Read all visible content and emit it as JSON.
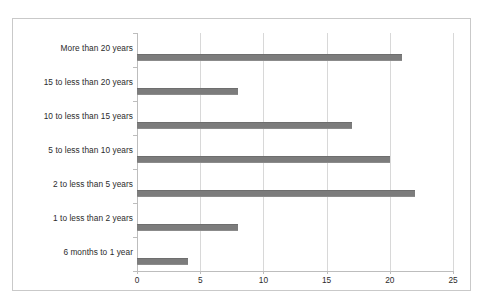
{
  "figure": {
    "background_color": "#ffffff",
    "frame_color": "#c9c9c9",
    "bar_color": "#7c7c7c",
    "gridline_color": "#d8d8d8",
    "axis_color": "#bdbdbd",
    "text_color": "#2b2b2b"
  },
  "chart_data": {
    "type": "bar",
    "orientation": "horizontal",
    "title": "",
    "subtitle": "",
    "xlabel": "",
    "ylabel": "",
    "categories": [
      "More than 20 years",
      "15 to less than 20 years",
      "10 to less than 15 years",
      "5 to less than 10 years",
      "2 to less than 5 years",
      "1 to less than 2 years",
      "6 months to 1 year"
    ],
    "values": [
      21,
      8,
      17,
      20,
      22,
      8,
      4
    ],
    "xlim": [
      0,
      25
    ],
    "xticks": [
      0,
      5,
      10,
      15,
      20,
      25
    ],
    "xtick_labels": [
      "0",
      "5",
      "10",
      "15",
      "20",
      "25"
    ],
    "grid": true,
    "grid_axis": "x",
    "legend": false,
    "legend_position": "none",
    "data_labels": false,
    "series": [
      {
        "name": "",
        "values": [
          21,
          8,
          17,
          20,
          22,
          8,
          4
        ]
      }
    ]
  }
}
